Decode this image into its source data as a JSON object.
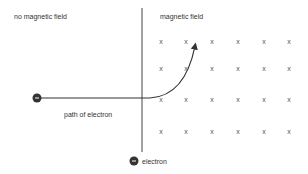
{
  "labels": {
    "no_field": "no magnetic field",
    "field": "magnetic field",
    "path": "path of electron",
    "electron": "electron"
  },
  "field_symbol": "x",
  "electron_symbol": "−",
  "colors": {
    "line": "#444444",
    "electron_fill": "#333333",
    "text": "#333333",
    "field_mark": "#555555"
  },
  "grid": {
    "columns_x": [
      161,
      186,
      212,
      238,
      264,
      289
    ],
    "rows_y": [
      41,
      68,
      99,
      131
    ]
  }
}
